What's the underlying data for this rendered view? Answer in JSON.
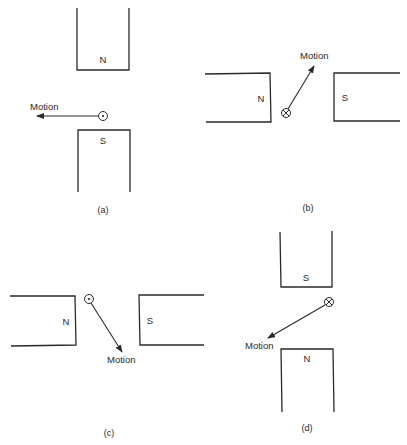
{
  "panels": {
    "a": {
      "caption": "(a)",
      "top_pole": "N",
      "bottom_pole": "S",
      "conductor_symbol": "dot",
      "conductor_meaning": "current out of page",
      "motion_label": "Motion",
      "motion_direction": "left"
    },
    "b": {
      "caption": "(b)",
      "left_pole": "N",
      "right_pole": "S",
      "conductor_symbol": "cross",
      "conductor_meaning": "current into page",
      "motion_label": "Motion",
      "motion_direction": "up-right"
    },
    "c": {
      "caption": "(c)",
      "left_pole": "N",
      "right_pole": "S",
      "conductor_symbol": "dot",
      "conductor_meaning": "current out of page",
      "motion_label": "Motion",
      "motion_direction": "down-right"
    },
    "d": {
      "caption": "(d)",
      "top_pole": "S",
      "bottom_pole": "N",
      "conductor_symbol": "cross",
      "conductor_meaning": "current into page",
      "motion_label": "Motion",
      "motion_direction": "down-left"
    }
  },
  "colors": {
    "ink": "#2a2a2a",
    "background": "#ffffff"
  }
}
